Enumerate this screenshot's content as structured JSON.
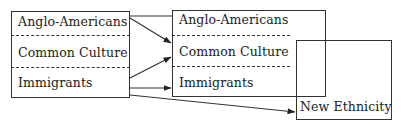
{
  "diagram": {
    "left_box": {
      "rows": [
        "Anglo-Americans",
        "Common Culture",
        "Immigrants"
      ]
    },
    "middle_box": {
      "rows": [
        "Anglo-Americans",
        "Common Culture",
        "Immigrants"
      ]
    },
    "right_box": {
      "label": "New Ethnicity"
    },
    "arrows": [
      {
        "from": "left.Anglo-Americans",
        "to": "middle.Common Culture"
      },
      {
        "from": "left.Immigrants",
        "to": "middle.Common Culture"
      },
      {
        "from": "left.Immigrants",
        "to": "middle.Immigrants"
      },
      {
        "from": "left.Immigrants",
        "to": "right.New Ethnicity"
      },
      {
        "from": "left.Anglo-Americans",
        "to": "middle.Anglo-Americans",
        "style": "line"
      }
    ],
    "colors": {
      "line": "#333333",
      "background": "#ffffff"
    }
  }
}
